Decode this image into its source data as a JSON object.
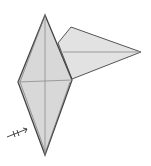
{
  "diagram": {
    "type": "origami-step",
    "colors": {
      "background": "#ffffff",
      "paper_front": "#d6d6d6",
      "paper_light": "#e4e4e4",
      "outline": "#555555",
      "crease": "#8a8a8a"
    },
    "kite": {
      "top": [
        45,
        15
      ],
      "left": [
        18,
        82
      ],
      "right": [
        72,
        80
      ],
      "bottom": [
        45,
        155
      ]
    },
    "flap": {
      "points": [
        [
          58,
          43
        ],
        [
          71,
          27
        ],
        [
          141,
          52
        ],
        [
          72,
          79
        ]
      ],
      "crease": [
        [
          63,
          52
        ],
        [
          141,
          52
        ]
      ]
    },
    "symbol": {
      "name": "repeat-arrow",
      "from": [
        8,
        136
      ],
      "to": [
        27,
        128
      ]
    }
  }
}
